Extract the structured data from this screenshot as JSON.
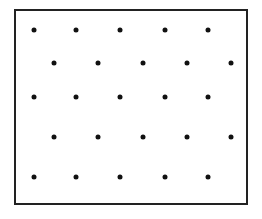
{
  "figure": {
    "title": "Staggered dot lattice inside rectangular frame",
    "canvas": {
      "width": 262,
      "height": 219,
      "background": "#ffffff"
    },
    "frame": {
      "name": "rectangular-border",
      "x": 14,
      "y": 9,
      "width": 234,
      "height": 196,
      "border_width": 2,
      "border_color": "#222222",
      "fill": "#ffffff"
    },
    "dot_style": {
      "diameter": 5,
      "color": "#111111",
      "shape": "circle"
    }
  },
  "chart_data": {
    "type": "scatter",
    "title": "Staggered dot lattice inside rectangular frame",
    "xlabel": "",
    "ylabel": "",
    "grid": false,
    "legend": "none",
    "xlim": [
      14,
      248
    ],
    "ylim": [
      9,
      205
    ],
    "row_count": 5,
    "dots_per_row": 5,
    "total_dots": 25,
    "row_offset_pattern": "alternating",
    "row_y": [
      30,
      63,
      97,
      137,
      177
    ],
    "row_x_odd": [
      34,
      76,
      120,
      165,
      208
    ],
    "row_x_even": [
      54,
      98,
      143,
      187,
      231
    ],
    "rows": [
      {
        "index": 1,
        "y": 30,
        "x": [
          34,
          76,
          120,
          165,
          208
        ]
      },
      {
        "index": 2,
        "y": 63,
        "x": [
          54,
          98,
          143,
          187,
          231
        ]
      },
      {
        "index": 3,
        "y": 97,
        "x": [
          34,
          76,
          120,
          165,
          208
        ]
      },
      {
        "index": 4,
        "y": 137,
        "x": [
          54,
          98,
          143,
          187,
          231
        ]
      },
      {
        "index": 5,
        "y": 177,
        "x": [
          34,
          76,
          120,
          165,
          208
        ]
      }
    ],
    "points": [
      {
        "x": 34,
        "y": 30
      },
      {
        "x": 76,
        "y": 30
      },
      {
        "x": 120,
        "y": 30
      },
      {
        "x": 165,
        "y": 30
      },
      {
        "x": 208,
        "y": 30
      },
      {
        "x": 54,
        "y": 63
      },
      {
        "x": 98,
        "y": 63
      },
      {
        "x": 143,
        "y": 63
      },
      {
        "x": 187,
        "y": 63
      },
      {
        "x": 231,
        "y": 63
      },
      {
        "x": 34,
        "y": 97
      },
      {
        "x": 76,
        "y": 97
      },
      {
        "x": 120,
        "y": 97
      },
      {
        "x": 165,
        "y": 97
      },
      {
        "x": 208,
        "y": 97
      },
      {
        "x": 54,
        "y": 137
      },
      {
        "x": 98,
        "y": 137
      },
      {
        "x": 143,
        "y": 137
      },
      {
        "x": 187,
        "y": 137
      },
      {
        "x": 231,
        "y": 137
      },
      {
        "x": 34,
        "y": 177
      },
      {
        "x": 76,
        "y": 177
      },
      {
        "x": 120,
        "y": 177
      },
      {
        "x": 165,
        "y": 177
      },
      {
        "x": 208,
        "y": 177
      }
    ]
  }
}
